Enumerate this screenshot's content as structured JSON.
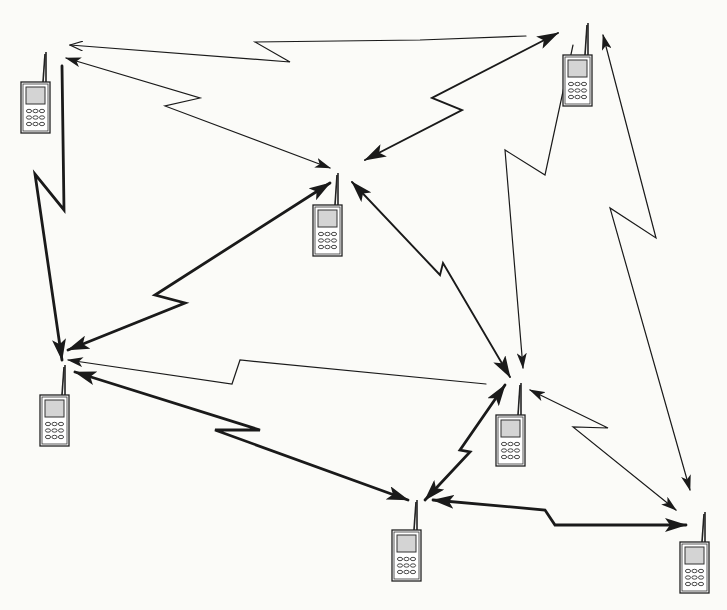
{
  "diagram": {
    "title": "Mobile ad hoc network",
    "type": "network-topology",
    "background": "#fbfbf8",
    "stroke_color": "#1a1a1a",
    "nodes": [
      {
        "id": "P1",
        "label": "phone-top-left",
        "x": 21,
        "y": 82,
        "antenna_top": 52
      },
      {
        "id": "P2",
        "label": "phone-top-right",
        "x": 563,
        "y": 55,
        "antenna_top": 23
      },
      {
        "id": "P3",
        "label": "phone-center",
        "x": 313,
        "y": 205,
        "antenna_top": 173
      },
      {
        "id": "P4",
        "label": "phone-left",
        "x": 40,
        "y": 395,
        "antenna_top": 365
      },
      {
        "id": "P5",
        "label": "phone-center-right",
        "x": 496,
        "y": 415,
        "antenna_top": 383
      },
      {
        "id": "P6",
        "label": "phone-bottom",
        "x": 392,
        "y": 530,
        "antenna_top": 500
      },
      {
        "id": "P7",
        "label": "phone-bottom-right",
        "x": 680,
        "y": 542,
        "antenna_top": 512
      }
    ],
    "links": [
      {
        "from": "P2",
        "to": "P1",
        "weight": "thin",
        "direction": "to",
        "points": [
          [
            526,
            36
          ],
          [
            420,
            40
          ],
          [
            255,
            42
          ],
          [
            290,
            62
          ],
          [
            70,
            45
          ]
        ]
      },
      {
        "from": "P1",
        "to": "P3",
        "weight": "thin",
        "direction": "both",
        "points": [
          [
            66,
            58
          ],
          [
            200,
            98
          ],
          [
            165,
            106
          ],
          [
            330,
            168
          ]
        ]
      },
      {
        "from": "P2",
        "to": "P4",
        "weight": "medium",
        "direction": "both",
        "points": [
          [
            558,
            33
          ],
          [
            432,
            98
          ],
          [
            462,
            110
          ],
          [
            365,
            160
          ]
        ]
      },
      {
        "from": "P1",
        "to": "P4",
        "weight": "thick",
        "direction": "to",
        "points": [
          [
            62,
            66
          ],
          [
            64,
            210
          ],
          [
            35,
            174
          ],
          [
            62,
            360
          ]
        ]
      },
      {
        "from": "P3",
        "to": "P4",
        "weight": "thick",
        "direction": "both",
        "points": [
          [
            330,
            183
          ],
          [
            155,
            295
          ],
          [
            185,
            303
          ],
          [
            68,
            350
          ]
        ]
      },
      {
        "from": "P3",
        "to": "P5",
        "weight": "medium",
        "direction": "both",
        "points": [
          [
            352,
            182
          ],
          [
            440,
            275
          ],
          [
            443,
            263
          ],
          [
            510,
            377
          ]
        ]
      },
      {
        "from": "P2",
        "to": "P5",
        "weight": "thin",
        "direction": "to",
        "points": [
          [
            573,
            45
          ],
          [
            545,
            175
          ],
          [
            505,
            150
          ],
          [
            523,
            368
          ]
        ]
      },
      {
        "from": "P5",
        "to": "P4",
        "weight": "thin",
        "direction": "to",
        "points": [
          [
            486,
            384
          ],
          [
            240,
            360
          ],
          [
            232,
            384
          ],
          [
            68,
            360
          ]
        ]
      },
      {
        "from": "P4",
        "to": "P6",
        "weight": "thick",
        "direction": "both",
        "points": [
          [
            75,
            372
          ],
          [
            260,
            430
          ],
          [
            215,
            430
          ],
          [
            408,
            500
          ]
        ]
      },
      {
        "from": "P5",
        "to": "P6",
        "weight": "thick",
        "direction": "both",
        "points": [
          [
            505,
            385
          ],
          [
            460,
            450
          ],
          [
            470,
            452
          ],
          [
            425,
            500
          ]
        ]
      },
      {
        "from": "P2",
        "to": "P7",
        "weight": "thin",
        "direction": "both",
        "points": [
          [
            603,
            35
          ],
          [
            656,
            238
          ],
          [
            610,
            208
          ],
          [
            690,
            490
          ]
        ]
      },
      {
        "from": "P5",
        "to": "P7",
        "weight": "thin",
        "direction": "both",
        "points": [
          [
            530,
            390
          ],
          [
            608,
            428
          ],
          [
            573,
            427
          ],
          [
            676,
            510
          ]
        ]
      },
      {
        "from": "P6",
        "to": "P7",
        "weight": "thick",
        "direction": "both",
        "points": [
          [
            433,
            500
          ],
          [
            545,
            510
          ],
          [
            555,
            525
          ],
          [
            686,
            525
          ]
        ]
      }
    ]
  }
}
